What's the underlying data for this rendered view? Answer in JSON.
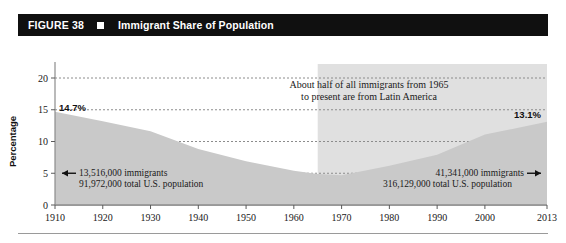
{
  "header": {
    "figure_number": "FIGURE 38",
    "marker_icon": "square-marker-icon",
    "title": "Immigrant Share of Population",
    "bar_color": "#101010",
    "text_color": "#ffffff"
  },
  "chart_data": {
    "type": "area",
    "title": "Immigrant Share of Population",
    "xlabel": "",
    "ylabel": "Percentage",
    "xlim": [
      1910,
      2013
    ],
    "ylim": [
      0,
      20
    ],
    "yticks": [
      0,
      5,
      10,
      15,
      20
    ],
    "xticks": [
      1910,
      1920,
      1930,
      1940,
      1950,
      1960,
      1970,
      1980,
      1990,
      2000,
      2013
    ],
    "grid": true,
    "legend": "none",
    "area_color": "#c9c9c9",
    "highlight_color": "#e0e0e0",
    "x": [
      1910,
      1920,
      1930,
      1940,
      1950,
      1960,
      1965,
      1970,
      1980,
      1990,
      2000,
      2013
    ],
    "values": [
      14.7,
      13.2,
      11.6,
      8.8,
      6.9,
      5.4,
      4.9,
      4.7,
      6.2,
      7.9,
      11.1,
      13.1
    ],
    "data_labels": [
      {
        "text": "14.7%",
        "x": 1910,
        "y": 14.7
      },
      {
        "text": "13.1%",
        "x": 2013,
        "y": 13.1
      }
    ],
    "highlight_region": {
      "start": 1965,
      "end": 2013,
      "note": "shaded band from 1965 to present"
    },
    "annotations": [
      {
        "name": "left-annotation",
        "arrow": "left-arrow-icon",
        "line1": "13,516,000 immigrants",
        "line2": "91,972,000 total U.S. population"
      },
      {
        "name": "right-annotation",
        "arrow": "right-arrow-icon",
        "line1": "41,341,000 immigrants",
        "line2": "316,129,000 total U.S. population"
      },
      {
        "name": "callout",
        "line1": "About half of all immigrants from 1965",
        "line2": "to present are from Latin America"
      }
    ]
  }
}
